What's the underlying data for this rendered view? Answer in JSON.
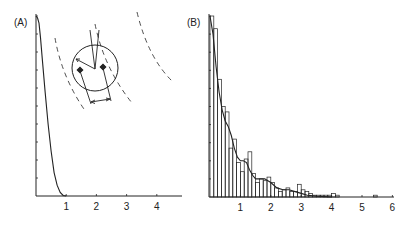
{
  "chart_data": [
    {
      "panel_label": "(A)",
      "type": "line",
      "title": "",
      "xlabel": "",
      "ylabel": "",
      "xlim": [
        0,
        4.8
      ],
      "x_ticks": [
        1,
        2,
        3,
        4
      ],
      "y_ticks_count": 10,
      "grid": false,
      "series": [
        {
          "name": "distribution",
          "x": [
            0.0,
            0.05,
            0.1,
            0.15,
            0.2,
            0.3,
            0.4,
            0.5,
            0.6,
            0.7,
            0.8,
            0.9,
            1.0
          ],
          "y": [
            1.0,
            0.99,
            0.96,
            0.88,
            0.78,
            0.58,
            0.4,
            0.25,
            0.13,
            0.06,
            0.02,
            0.003,
            0.0
          ]
        }
      ],
      "inset": {
        "description": "schematic: circle with two marked points, converging lines, radius arrow, dimension arrow between points, and three dashed arcs"
      }
    },
    {
      "panel_label": "(B)",
      "type": "bar",
      "title": "",
      "xlabel": "",
      "ylabel": "",
      "xlim": [
        0,
        6
      ],
      "x_ticks": [
        1,
        2,
        3,
        4,
        5,
        6
      ],
      "y_ticks_count": 10,
      "grid": false,
      "bin_width": 0.125,
      "bins_start": [
        0.0,
        0.125,
        0.25,
        0.375,
        0.5,
        0.625,
        0.75,
        0.875,
        1.0,
        1.125,
        1.25,
        1.375,
        1.5,
        1.625,
        1.75,
        1.875,
        2.0,
        2.125,
        2.25,
        2.375,
        2.5,
        2.625,
        2.75,
        2.875,
        3.0,
        3.125,
        3.25,
        3.375,
        3.5,
        3.625,
        3.75,
        3.875,
        4.0,
        4.125,
        5.375
      ],
      "values": [
        1.0,
        0.93,
        0.65,
        0.5,
        0.47,
        0.27,
        0.32,
        0.19,
        0.14,
        0.21,
        0.25,
        0.13,
        0.08,
        0.1,
        0.09,
        0.11,
        0.08,
        0.05,
        0.03,
        0.04,
        0.05,
        0.03,
        0.03,
        0.07,
        0.04,
        0.03,
        0.02,
        0.01,
        0.01,
        0.01,
        0.01,
        0.01,
        0.02,
        0.01,
        0.01
      ],
      "series": [
        {
          "name": "smoothed fit",
          "type": "line",
          "x": [
            0.0,
            0.1,
            0.2,
            0.3,
            0.4,
            0.5,
            0.6,
            0.7,
            0.8,
            0.9,
            1.0,
            1.1,
            1.2,
            1.3,
            1.4,
            1.5,
            1.6,
            1.8,
            2.0,
            2.2,
            2.4,
            2.6,
            2.8,
            3.0,
            3.2,
            3.5,
            4.0
          ],
          "y": [
            1.0,
            0.9,
            0.72,
            0.58,
            0.48,
            0.42,
            0.39,
            0.34,
            0.27,
            0.22,
            0.2,
            0.2,
            0.19,
            0.15,
            0.12,
            0.1,
            0.1,
            0.1,
            0.08,
            0.05,
            0.04,
            0.04,
            0.03,
            0.02,
            0.01,
            0.005,
            0.0
          ]
        }
      ]
    }
  ],
  "labels": {
    "panel_a": "(A)",
    "panel_b": "(B)"
  }
}
